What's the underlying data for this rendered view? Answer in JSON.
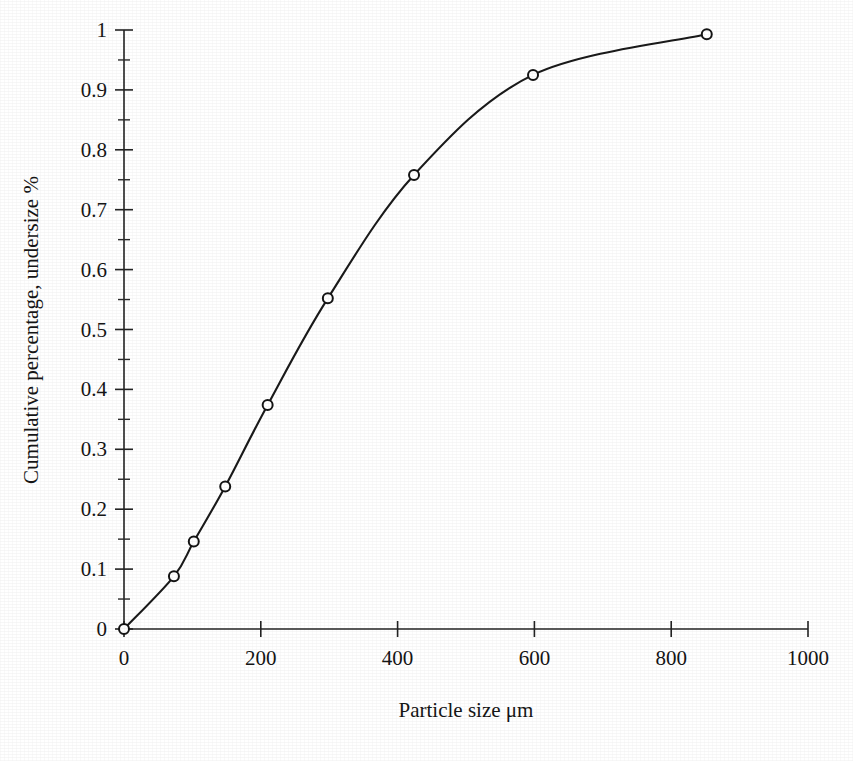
{
  "chart_data": {
    "type": "line",
    "title": "",
    "subtitle": "",
    "xlabel": "Particle size μm",
    "ylabel": "Cumulative percentage, undersize %",
    "xlim": [
      0,
      1000
    ],
    "ylim": [
      0,
      1
    ],
    "grid": false,
    "legend": "none",
    "marker": "open-circle",
    "x_ticks": [
      "0",
      "200",
      "400",
      "600",
      "800",
      "1000"
    ],
    "x_tick_values": [
      0,
      200,
      400,
      600,
      800,
      1000
    ],
    "y_ticks": [
      "0",
      "0.1",
      "0.2",
      "0.3",
      "0.4",
      "0.5",
      "0.6",
      "0.7",
      "0.8",
      "0.9",
      "1"
    ],
    "y_tick_values": [
      0,
      0.1,
      0.2,
      0.3,
      0.4,
      0.5,
      0.6,
      0.7,
      0.8,
      0.9,
      1
    ],
    "y_minor_tick_values": [
      0.05,
      0.15,
      0.25,
      0.35,
      0.45,
      0.55,
      0.65,
      0.75,
      0.85,
      0.95
    ],
    "series": [
      {
        "name": "Cumulative undersize",
        "x": [
          0,
          73,
          102,
          148,
          210,
          298,
          424,
          598,
          852
        ],
        "values": [
          0.0,
          0.088,
          0.146,
          0.238,
          0.374,
          0.552,
          0.758,
          0.925,
          0.993
        ]
      }
    ],
    "colors": {
      "line": "#1a1a1a",
      "marker_fill": "#ffffff",
      "marker_stroke": "#141414",
      "axis": "#232323",
      "text": "#151515",
      "background": "#ffffff"
    }
  }
}
